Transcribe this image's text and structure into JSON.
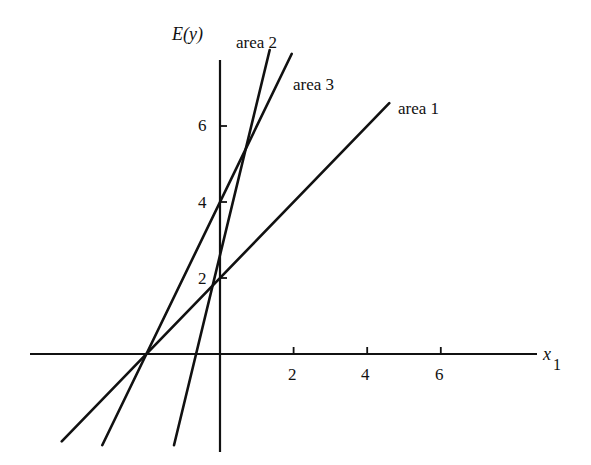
{
  "chart_data": {
    "type": "line",
    "title": "",
    "xlabel": "x1",
    "xlabel_main": "x",
    "xlabel_sub": "1",
    "ylabel": "E(y)",
    "x_ticks": [
      2,
      4,
      6
    ],
    "y_ticks": [
      2,
      4,
      6
    ],
    "xlim": [
      -5.5,
      8.7
    ],
    "ylim": [
      -2.5,
      9.3
    ],
    "grid": false,
    "legend": "inline labels at line ends",
    "series": [
      {
        "name": "area 1",
        "intercept": 2.0,
        "slope": 1.0,
        "x_range": [
          -4.3,
          4.6
        ]
      },
      {
        "name": "area 2",
        "intercept": 2.6,
        "slope": 4.0,
        "x_range": [
          -1.25,
          1.35
        ]
      },
      {
        "name": "area 3",
        "intercept": 4.0,
        "slope": 2.0,
        "x_range": [
          -3.2,
          1.95
        ]
      }
    ]
  },
  "labels": {
    "y_axis": "E(y)",
    "x_axis_main": "x",
    "x_axis_sub": "1",
    "x_ticks": [
      "2",
      "4",
      "6"
    ],
    "y_ticks": [
      "2",
      "4",
      "6"
    ],
    "series": [
      "area 1",
      "area 2",
      "area 3"
    ]
  },
  "colors": {
    "ink": "#111111",
    "background": "#ffffff"
  }
}
